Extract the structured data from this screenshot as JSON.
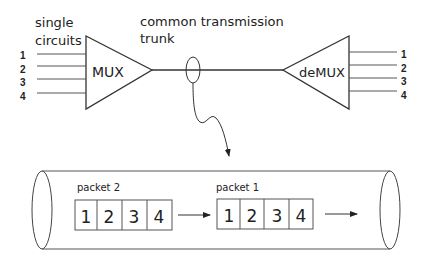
{
  "labels": {
    "single_circuits_line1": "single",
    "single_circuits_line2": "circuits",
    "trunk_line1": "common transmission",
    "trunk_line2": "trunk",
    "mux": "MUX",
    "demux": "deMUX",
    "packet2": "packet 2",
    "packet1": "packet 1"
  },
  "inputs": [
    "1",
    "2",
    "3",
    "4"
  ],
  "outputs": [
    "1",
    "2",
    "3",
    "4"
  ],
  "packet2_cells": [
    "1",
    "2",
    "3",
    "4"
  ],
  "packet1_cells": [
    "1",
    "2",
    "3",
    "4"
  ],
  "colors": {
    "stroke": "#333333",
    "text": "#222222",
    "background": "#ffffff"
  }
}
